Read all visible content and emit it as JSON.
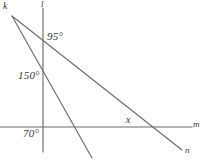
{
  "figure": {
    "type": "geometry-diagram",
    "background_color": "#ffffff",
    "stroke_color": "#6b6b6b",
    "text_color": "#3a3a3a",
    "width": 205,
    "height": 162
  },
  "lines": [
    {
      "id": "line-l",
      "label": "l",
      "orientation": "vertical",
      "x1": 43,
      "y1": 8,
      "x2": 43,
      "y2": 152
    },
    {
      "id": "line-m",
      "label": "m",
      "orientation": "horizontal",
      "x1": 0,
      "y1": 127,
      "x2": 192,
      "y2": 127
    },
    {
      "id": "line-n",
      "label": "n",
      "orientation": "shallow-diagonal",
      "x1": 12,
      "y1": 16,
      "x2": 182,
      "y2": 150
    },
    {
      "id": "line-steep",
      "label": "",
      "orientation": "steep-diagonal",
      "x1": 12,
      "y1": 16,
      "x2": 92,
      "y2": 158
    }
  ],
  "vertices": [
    {
      "id": "vertex-k",
      "label": "k",
      "x": 12,
      "y": 14
    }
  ],
  "angles": [
    {
      "id": "angle-95",
      "label": "95°",
      "value": 95,
      "unit": "degrees",
      "at": "intersection of line l and line n"
    },
    {
      "id": "angle-150",
      "label": "150°",
      "value": 150,
      "unit": "degrees",
      "at": "on line l below the 95 degree vertex"
    },
    {
      "id": "angle-70",
      "label": "70°",
      "value": 70,
      "unit": "degrees",
      "at": "intersection of line l and line m, below left"
    },
    {
      "id": "angle-x",
      "label": "x",
      "value": null,
      "unit": "unknown",
      "at": "intersection of line m and line n, above left"
    }
  ],
  "labels": {
    "vertex_k": "k",
    "line_l": "l",
    "line_m": "m",
    "line_n": "n",
    "angle_95": "95°",
    "angle_150": "150°",
    "angle_70": "70°",
    "angle_x": "x"
  }
}
